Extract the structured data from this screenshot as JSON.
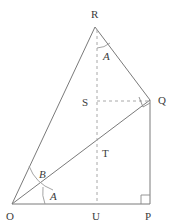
{
  "figure": {
    "type": "geometry-diagram",
    "width": 174,
    "height": 224,
    "background_color": "#ffffff",
    "stroke_color": "#7a7a7a",
    "dash_color": "#a8a8a8",
    "label_color": "#3b3b3b",
    "vertices": [
      {
        "name": "O",
        "label": "O",
        "x": 12,
        "y": 204,
        "label_x": 8,
        "label_y": 219
      },
      {
        "name": "P",
        "label": "P",
        "x": 150,
        "y": 204,
        "label_x": 146,
        "label_y": 219
      },
      {
        "name": "Q",
        "label": "Q",
        "x": 150,
        "y": 100,
        "label_x": 158,
        "label_y": 104
      },
      {
        "name": "R",
        "label": "R",
        "x": 95,
        "y": 27,
        "label_x": 91,
        "label_y": 18
      },
      {
        "name": "U",
        "label": "U",
        "x": 97,
        "y": 204,
        "label_x": 93,
        "label_y": 219
      },
      {
        "name": "S",
        "label": "S",
        "x": 97,
        "y": 101,
        "label_x": 82,
        "label_y": 106
      },
      {
        "name": "T",
        "label": "T",
        "x": 97,
        "y": 152,
        "label_x": 102,
        "label_y": 157
      }
    ],
    "solid_segments": [
      {
        "name": "segment-OR",
        "from": "O",
        "to": "R"
      },
      {
        "name": "segment-RQ",
        "from": "R",
        "to": "Q"
      },
      {
        "name": "segment-QP",
        "from": "Q",
        "to": "P"
      },
      {
        "name": "segment-OP",
        "from": "O",
        "to": "P"
      },
      {
        "name": "segment-OQ",
        "from": "O",
        "to": "Q"
      }
    ],
    "dashed_segments": [
      {
        "name": "segment-RU",
        "from": "R",
        "to": "U"
      },
      {
        "name": "segment-SQ",
        "from": "S",
        "to": "Q"
      }
    ],
    "angle_labels": [
      {
        "name": "angle-label-R-A",
        "text": "A",
        "x": 104,
        "y": 56
      },
      {
        "name": "angle-label-O-B",
        "text": "B",
        "x": 41,
        "y": 174
      },
      {
        "name": "angle-label-O-A",
        "text": "A",
        "x": 51,
        "y": 196
      }
    ],
    "right_angle_markers": [
      {
        "name": "right-angle-marker-P",
        "x": 150,
        "y": 204
      },
      {
        "name": "right-angle-marker-Q",
        "x": 150,
        "y": 100
      }
    ]
  }
}
